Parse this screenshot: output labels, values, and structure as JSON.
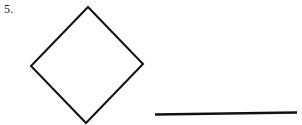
{
  "page": {
    "background_color": "#ffffff",
    "width": 302,
    "height": 125
  },
  "figure": {
    "item_number": "5.",
    "stroke_color": "#111111",
    "fill_color": "none",
    "shapes": [
      {
        "name": "diamond",
        "type": "polygon",
        "label": "quadrilateral rhombus rotated 45 degrees",
        "stroke_width": 2,
        "points": "88,7 143,64 86,123 31,66"
      },
      {
        "name": "line-segment",
        "type": "line",
        "label": "horizontal line segment",
        "stroke_width": 2.6,
        "x1": 155,
        "y1": 114.5,
        "x2": 297,
        "y2": 112.5
      }
    ]
  }
}
